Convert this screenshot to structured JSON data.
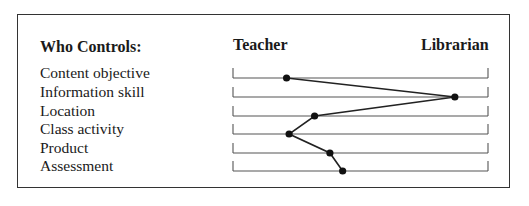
{
  "header": {
    "category_label": "Who Controls:",
    "left_pole": "Teacher",
    "right_pole": "Librarian"
  },
  "rows": [
    {
      "label": "Content objective",
      "position": 0.21
    },
    {
      "label": "Information skill",
      "position": 0.87
    },
    {
      "label": "Location",
      "position": 0.32
    },
    {
      "label": "Class activity",
      "position": 0.22
    },
    {
      "label": "Product",
      "position": 0.38
    },
    {
      "label": "Assessment",
      "position": 0.43
    }
  ],
  "chart_data": {
    "type": "line",
    "title": "Who Controls:",
    "x_axis": {
      "left": "Teacher",
      "right": "Librarian",
      "range": [
        0,
        1
      ]
    },
    "categories": [
      "Content objective",
      "Information skill",
      "Location",
      "Class activity",
      "Product",
      "Assessment"
    ],
    "values": [
      0.21,
      0.87,
      0.32,
      0.22,
      0.38,
      0.43
    ]
  }
}
